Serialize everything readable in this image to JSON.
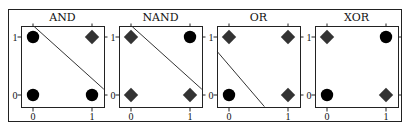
{
  "figure": {
    "panels": [
      {
        "title": "AND",
        "x_ticks": [
          "0",
          "1"
        ],
        "y_ticks": [
          "0",
          "1"
        ],
        "points": [
          {
            "x": 0,
            "y": 1,
            "marker": "circle"
          },
          {
            "x": 1,
            "y": 1,
            "marker": "diamond"
          },
          {
            "x": 0,
            "y": 0,
            "marker": "circle"
          },
          {
            "x": 1,
            "y": 0,
            "marker": "circle"
          }
        ],
        "line": {
          "from": [
            0.02,
            1.18
          ],
          "to": [
            1.2,
            0.1
          ]
        }
      },
      {
        "title": "NAND",
        "x_ticks": [
          "0",
          "1"
        ],
        "y_ticks": [
          "0",
          "1"
        ],
        "points": [
          {
            "x": 0,
            "y": 1,
            "marker": "diamond"
          },
          {
            "x": 1,
            "y": 1,
            "marker": "circle"
          },
          {
            "x": 0,
            "y": 0,
            "marker": "diamond"
          },
          {
            "x": 1,
            "y": 0,
            "marker": "diamond"
          }
        ],
        "line": {
          "from": [
            0.02,
            1.18
          ],
          "to": [
            1.2,
            0.1
          ]
        }
      },
      {
        "title": "OR",
        "x_ticks": [
          "0",
          "1"
        ],
        "y_ticks": [
          "0",
          "1"
        ],
        "points": [
          {
            "x": 0,
            "y": 1,
            "marker": "diamond"
          },
          {
            "x": 1,
            "y": 1,
            "marker": "diamond"
          },
          {
            "x": 0,
            "y": 0,
            "marker": "circle"
          },
          {
            "x": 1,
            "y": 0,
            "marker": "diamond"
          }
        ],
        "line": {
          "from": [
            -0.2,
            0.75
          ],
          "to": [
            0.6,
            -0.2
          ]
        }
      },
      {
        "title": "XOR",
        "x_ticks": [
          "0",
          "1"
        ],
        "y_ticks": [
          "0",
          "1"
        ],
        "points": [
          {
            "x": 0,
            "y": 1,
            "marker": "diamond"
          },
          {
            "x": 1,
            "y": 1,
            "marker": "circle"
          },
          {
            "x": 0,
            "y": 0,
            "marker": "circle"
          },
          {
            "x": 1,
            "y": 0,
            "marker": "diamond"
          }
        ],
        "line": null
      }
    ]
  },
  "style": {
    "circle_color": "#000000",
    "diamond_color": "#333333",
    "frame_color": "#222222",
    "line_color": "#333333"
  }
}
